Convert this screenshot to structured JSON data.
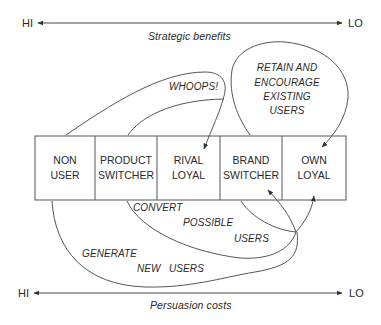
{
  "top_axis": {
    "left_label": "HI",
    "right_label": "LO",
    "title": "Strategic benefits"
  },
  "bottom_axis": {
    "left_label": "HI",
    "right_label": "LO",
    "title": "Persuasion costs"
  },
  "segments": [
    {
      "line1": "NON",
      "line2": "USER"
    },
    {
      "line1": "PRODUCT",
      "line2": "SWITCHER"
    },
    {
      "line1": "RIVAL",
      "line2": "LOYAL"
    },
    {
      "line1": "BRAND",
      "line2": "SWITCHER"
    },
    {
      "line1": "OWN",
      "line2": "LOYAL"
    }
  ],
  "annotations": {
    "whoops": "WHOOPS!",
    "retain": [
      "RETAIN AND",
      "ENCOURAGE",
      "EXISTING",
      "USERS"
    ],
    "convert": [
      "CONVERT",
      "POSSIBLE",
      "USERS"
    ],
    "generate": [
      "GENERATE",
      "NEW",
      "USERS"
    ]
  },
  "colors": {
    "line": "#555555",
    "text": "#2a2a2a"
  }
}
